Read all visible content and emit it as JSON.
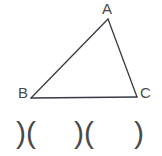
{
  "figure": {
    "name": "triangle-abc-with-congruence-marks",
    "background_color": "#ffffff",
    "stroke_color": "#3a3a44",
    "label_color": "#4a4a4a",
    "width": 162,
    "height": 156
  },
  "triangle": {
    "vertices": {
      "a": {
        "label": "A",
        "x": 108,
        "y": 19
      },
      "b": {
        "label": "B",
        "x": 31,
        "y": 98
      },
      "c": {
        "label": "C",
        "x": 137,
        "y": 97
      }
    },
    "sides": [
      {
        "name": "side-ab",
        "from": "a",
        "to": "b"
      },
      {
        "name": "side-ac",
        "from": "a",
        "to": "c"
      },
      {
        "name": "side-bc",
        "from": "b",
        "to": "c"
      }
    ]
  },
  "marks": {
    "groups": [
      {
        "name": "paren-pair-left",
        "text": ")("
      },
      {
        "name": "paren-pair-middle",
        "text": ")("
      },
      {
        "name": "paren-single-right",
        "text": ")"
      }
    ]
  }
}
